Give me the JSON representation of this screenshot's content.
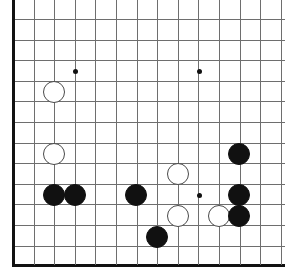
{
  "figure": {
    "kind": "go-board-diagram",
    "width": 285,
    "height": 279,
    "background_color": "#ffffff"
  },
  "board": {
    "origin_x": 13,
    "origin_y": 19,
    "spacing": 20.6,
    "line_color": "#6e6e6e",
    "edge_color": "#111111",
    "columns": 13,
    "rows": 12,
    "left_edge_is_border": true,
    "bottom_edge_is_border": true,
    "top_edge_is_border": false,
    "right_edge_is_border": false,
    "horizontal_lines": [
      19,
      39.6,
      60.2,
      80.8,
      101.4,
      122,
      142.6,
      163.2,
      183.8,
      204.4,
      225,
      245.6,
      265
    ],
    "vertical_lines": [
      13,
      33.6,
      54.2,
      74.8,
      95.4,
      116,
      136.6,
      157.2,
      177.8,
      198.4,
      219,
      239.6,
      260.2,
      280.8
    ]
  },
  "star_points": [
    {
      "name": "star-point-upper-left",
      "x": 75,
      "y": 71
    },
    {
      "name": "star-point-upper-right",
      "x": 199,
      "y": 71
    },
    {
      "name": "star-point-lower-right",
      "x": 199,
      "y": 195
    }
  ],
  "stones": {
    "radius": 11,
    "black_color": "#111111",
    "white_color": "#ffffff",
    "white_border_color": "#4a4a4a",
    "items": [
      {
        "name": "white-stone-1",
        "color": "white",
        "x": 54,
        "y": 92
      },
      {
        "name": "white-stone-2",
        "color": "white",
        "x": 54,
        "y": 154
      },
      {
        "name": "black-stone-1",
        "color": "black",
        "x": 54,
        "y": 195
      },
      {
        "name": "black-stone-2",
        "color": "black",
        "x": 75,
        "y": 195
      },
      {
        "name": "black-stone-3",
        "color": "black",
        "x": 136,
        "y": 195
      },
      {
        "name": "black-stone-4",
        "color": "black",
        "x": 157,
        "y": 237
      },
      {
        "name": "white-stone-3",
        "color": "white",
        "x": 178,
        "y": 174
      },
      {
        "name": "white-stone-4",
        "color": "white",
        "x": 178,
        "y": 216
      },
      {
        "name": "white-stone-5",
        "color": "white",
        "x": 219,
        "y": 216
      },
      {
        "name": "black-stone-5",
        "color": "black",
        "x": 239,
        "y": 154
      },
      {
        "name": "black-stone-6",
        "color": "black",
        "x": 239,
        "y": 195
      },
      {
        "name": "black-stone-7",
        "color": "black",
        "x": 239,
        "y": 216
      }
    ]
  }
}
